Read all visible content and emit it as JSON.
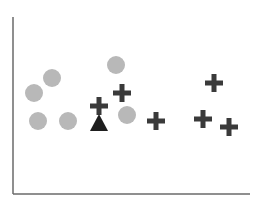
{
  "chart_data": {
    "type": "scatter",
    "title": "",
    "xlabel": "",
    "ylabel": "",
    "grid": false,
    "legend": null,
    "axes": {
      "origin_px": [
        13,
        194
      ],
      "x_end_px": 250,
      "y_top_px": 17
    },
    "colors": {
      "circle": "#b8b8b8",
      "plus": "#3a3a3a",
      "triangle": "#1e1e1e",
      "axis": "#6a6a6a"
    },
    "series": [
      {
        "name": "circle",
        "marker": "circle",
        "points": [
          [
            34,
            93
          ],
          [
            52,
            78
          ],
          [
            116,
            65
          ],
          [
            38,
            121
          ],
          [
            68,
            121
          ],
          [
            127,
            115
          ]
        ]
      },
      {
        "name": "plus",
        "marker": "plus",
        "points": [
          [
            99,
            106
          ],
          [
            122,
            93
          ],
          [
            156,
            121
          ],
          [
            214,
            83
          ],
          [
            203,
            119
          ],
          [
            229,
            127
          ]
        ]
      },
      {
        "name": "triangle",
        "marker": "triangle",
        "points": [
          [
            99,
            123
          ]
        ]
      }
    ]
  }
}
